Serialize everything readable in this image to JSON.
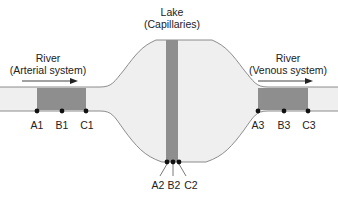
{
  "labels": {
    "lake_title": "Lake",
    "lake_subtitle": "(Capillaries)",
    "river_left_title": "River",
    "river_left_subtitle": "(Arterial system)",
    "river_right_title": "River",
    "river_right_subtitle": "(Venous system)"
  },
  "points": {
    "left": [
      "A1",
      "B1",
      "C1"
    ],
    "middle": [
      "A2",
      "B2",
      "C2"
    ],
    "right": [
      "A3",
      "B3",
      "C3"
    ]
  },
  "colors": {
    "channel_fill": "#efefef",
    "segment_fill": "#8e8e8e",
    "outline": "#808080",
    "arrow": "#444444",
    "dot": "#111111"
  }
}
